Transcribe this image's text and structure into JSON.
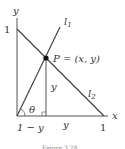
{
  "diagram": {
    "axis_labels": {
      "x": "x",
      "y": "y"
    },
    "tick_labels": {
      "y_one": "1",
      "x_one": "1"
    },
    "lines": {
      "l1": "l",
      "l1_sub": "1",
      "l2": "l",
      "l2_sub": "2"
    },
    "point": {
      "label": "P = (x, y)"
    },
    "segment_labels": {
      "vertical": "y",
      "horizontal": "y",
      "left": "1 − y"
    },
    "angle_label": "θ",
    "caption": "Figure 3.28"
  }
}
